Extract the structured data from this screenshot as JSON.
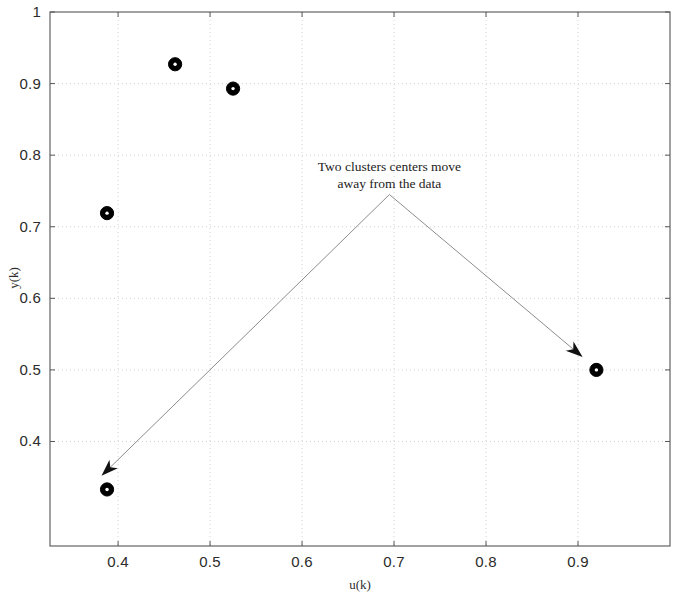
{
  "chart_data": {
    "type": "scatter",
    "title": "",
    "xlabel": "u(k)",
    "ylabel": "y(k)",
    "xlim": [
      0.326,
      1.0
    ],
    "ylim": [
      0.254,
      1.0
    ],
    "xticks": [
      0.4,
      0.5,
      0.6,
      0.7,
      0.8,
      0.9
    ],
    "xticklabels": [
      "0.4",
      "0.5",
      "0.6",
      "0.7",
      "0.8",
      "0.9"
    ],
    "yticks": [
      0.4,
      0.5,
      0.6,
      0.7,
      0.8,
      0.9,
      1.0
    ],
    "yticklabels": [
      "0.4",
      "0.5",
      "0.6",
      "0.7",
      "0.8",
      "0.9",
      "1"
    ],
    "grid": true,
    "grid_style": "dotted",
    "legend": null,
    "marker": "filled-circle-with-dot",
    "marker_color": "#000000",
    "series": [
      {
        "name": "data points",
        "x": [
          0.462,
          0.525,
          0.388
        ],
        "y": [
          0.927,
          0.893,
          0.719
        ]
      },
      {
        "name": "cluster centers",
        "x": [
          0.388,
          0.92
        ],
        "y": [
          0.333,
          0.5
        ]
      }
    ],
    "points": [
      {
        "x": 0.462,
        "y": 0.927
      },
      {
        "x": 0.525,
        "y": 0.893
      },
      {
        "x": 0.388,
        "y": 0.719
      },
      {
        "x": 0.388,
        "y": 0.333
      },
      {
        "x": 0.92,
        "y": 0.5
      }
    ],
    "annotations": [
      {
        "text_line1": "Two clusters centers move",
        "text_line2": "away from the data",
        "anchor": {
          "x": 0.695,
          "y": 0.745
        },
        "arrows": [
          {
            "from": {
              "x": 0.695,
              "y": 0.745
            },
            "to": {
              "x": 0.382,
              "y": 0.352
            }
          },
          {
            "from": {
              "x": 0.695,
              "y": 0.745
            },
            "to": {
              "x": 0.905,
              "y": 0.518
            }
          }
        ]
      }
    ]
  },
  "axes": {
    "x_title": "u(k)",
    "y_title": "y(k)",
    "x_tick_labels": [
      "0.4",
      "0.5",
      "0.6",
      "0.7",
      "0.8",
      "0.9"
    ],
    "y_tick_labels": [
      "1",
      "0.9",
      "0.8",
      "0.7",
      "0.6",
      "0.5",
      "0.4"
    ]
  },
  "annotation": {
    "line1": "Two clusters centers move",
    "line2": "away from the data"
  },
  "colors": {
    "marker": "#000000",
    "axis": "#555555",
    "grid": "#c8c8c8",
    "text": "#2b2b2b",
    "background": "#ffffff"
  }
}
